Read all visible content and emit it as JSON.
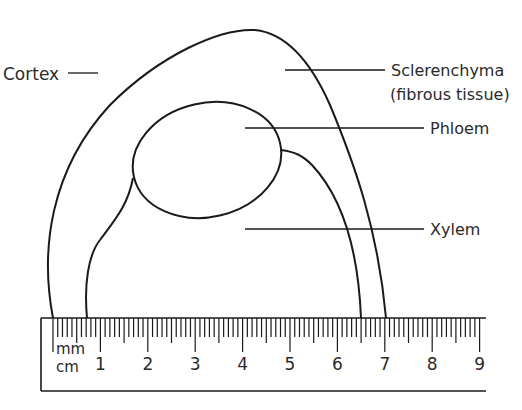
{
  "diagram": {
    "labels": {
      "cortex": "Cortex",
      "sclerenchyma_line1": "Sclerenchyma",
      "sclerenchyma_line2": "(fibrous tissue)",
      "phloem": "Phloem",
      "xylem": "Xylem"
    },
    "ruler": {
      "unit_small": "mm",
      "unit_large": "cm",
      "cm_ticks": [
        "1",
        "2",
        "3",
        "4",
        "5",
        "6",
        "7",
        "8",
        "9"
      ],
      "range_cm": [
        0,
        9
      ]
    },
    "colors": {
      "stroke": "#1a1a1a",
      "text": "#2a2a2a",
      "background": "#ffffff"
    }
  }
}
